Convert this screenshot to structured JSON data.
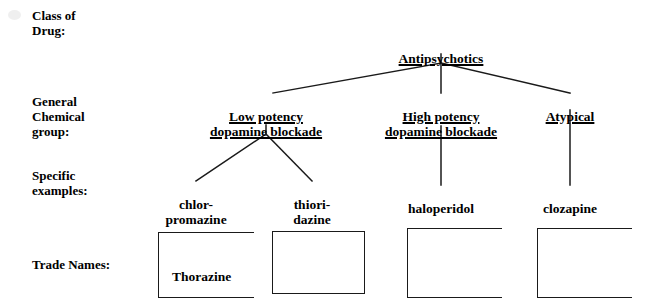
{
  "diagram": {
    "type": "tree",
    "title_text_color": "#000000",
    "line_color": "#1a1a1a",
    "background": "#ffffff",
    "row_labels": [
      {
        "id": "class-of-drug",
        "text": "Class of\nDrug:"
      },
      {
        "id": "general-chemical-group",
        "text": "General\nChemical\ngroup:"
      },
      {
        "id": "specific-examples",
        "text": "Specific\nexamples:"
      },
      {
        "id": "trade-names",
        "text": "Trade Names:"
      }
    ],
    "nodes": {
      "root": {
        "id": "antipsychotics",
        "text": "Antipsychotics",
        "underlined": true
      },
      "level2": [
        {
          "id": "low-potency",
          "text": "Low potency\ndopamine blockade",
          "underlined": true
        },
        {
          "id": "high-potency",
          "text": "High potency\ndopamine blockade",
          "underlined": true
        },
        {
          "id": "atypical",
          "text": "Atypical",
          "underlined": true
        }
      ],
      "level3": [
        {
          "id": "chlorpromazine",
          "text": "chlor-\npromazine",
          "underlined": false
        },
        {
          "id": "thioridazine",
          "text": "thiori-\ndazine",
          "underlined": false
        },
        {
          "id": "haloperidol",
          "text": "haloperidol",
          "underlined": false
        },
        {
          "id": "clozapine",
          "text": "clozapine",
          "underlined": false
        }
      ]
    },
    "trade_names": [
      {
        "id": "trade-box-chlorpromazine",
        "text": "Thorazine"
      },
      {
        "id": "trade-box-thioridazine",
        "text": ""
      },
      {
        "id": "trade-box-haloperidol",
        "text": ""
      },
      {
        "id": "trade-box-clozapine",
        "text": ""
      }
    ]
  }
}
